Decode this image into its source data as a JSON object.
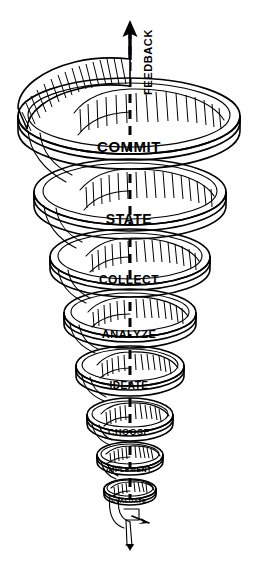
{
  "diagram": {
    "type": "conical-spiral-funnel",
    "background_color": "#ffffff",
    "line_color": "#000000",
    "feedback": {
      "label": "FEEDBACK",
      "orientation": "vertical-bottom-to-top",
      "x": 148,
      "y": 62,
      "arrow_direction": "up"
    },
    "stages": [
      {
        "label": "COMMIT",
        "x": 129,
        "y": 146,
        "font_size": 15,
        "cx": 129,
        "cy": 120,
        "rx": 111,
        "ry": 38,
        "band": 27
      },
      {
        "label": "STATE",
        "x": 129,
        "y": 219,
        "font_size": 14,
        "cx": 130,
        "cy": 196,
        "rx": 96,
        "ry": 33,
        "band": 24
      },
      {
        "label": "COLLECT",
        "x": 129,
        "y": 280,
        "font_size": 12,
        "cx": 130,
        "cy": 260,
        "rx": 80,
        "ry": 28,
        "band": 21
      },
      {
        "label": "ANALYZE",
        "x": 129,
        "y": 334,
        "font_size": 11,
        "cx": 130,
        "cy": 316,
        "rx": 66,
        "ry": 24,
        "band": 18
      },
      {
        "label": "IDEATE",
        "x": 129,
        "y": 385,
        "font_size": 10,
        "cx": 130,
        "cy": 369,
        "rx": 54,
        "ry": 20,
        "band": 16
      },
      {
        "label": "CHOOSE",
        "x": 129,
        "y": 432,
        "font_size": 9,
        "cx": 130,
        "cy": 418,
        "rx": 43,
        "ry": 17,
        "band": 13
      },
      {
        "label": "IMPLEMENT",
        "x": 129,
        "y": 469,
        "font_size": 7,
        "cx": 130,
        "cy": 457,
        "rx": 34,
        "ry": 13,
        "band": 11
      },
      {
        "label": "EVALUATE",
        "x": 129,
        "y": 501,
        "font_size": 6,
        "cx": 130,
        "cy": 491,
        "rx": 26,
        "ry": 10,
        "band": 9
      }
    ],
    "center_axis": {
      "x": 130,
      "top_y": 22,
      "bottom_y": 500,
      "style": "dashed"
    },
    "tail": {
      "description": "small looping tail ending in a downward arrow below EVALUATE",
      "x": 129,
      "y": 540
    }
  }
}
